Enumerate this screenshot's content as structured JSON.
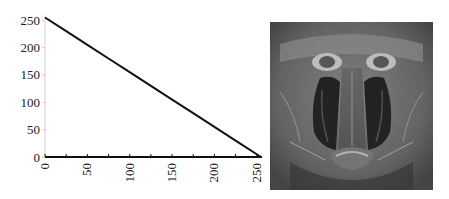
{
  "chart_data": {
    "type": "line",
    "title": "",
    "xlabel": "",
    "ylabel": "",
    "x": [
      0,
      25,
      50,
      75,
      100,
      125,
      150,
      175,
      200,
      225,
      255
    ],
    "series": [
      {
        "name": "transfer",
        "values": [
          255,
          230,
          205,
          180,
          155,
          130,
          105,
          80,
          55,
          30,
          0
        ]
      }
    ],
    "xlim": [
      0,
      255
    ],
    "ylim": [
      0,
      255
    ],
    "x_ticks": [
      "0",
      "50",
      "100",
      "150",
      "200",
      "250"
    ],
    "y_ticks": [
      "0",
      "50",
      "100",
      "150",
      "200",
      "250"
    ],
    "x_tick_rotation": -90,
    "grid": false,
    "legend": "none",
    "line_color": "#111111"
  },
  "image": {
    "subject": "mandrill-face",
    "colormap": "grayscale"
  }
}
